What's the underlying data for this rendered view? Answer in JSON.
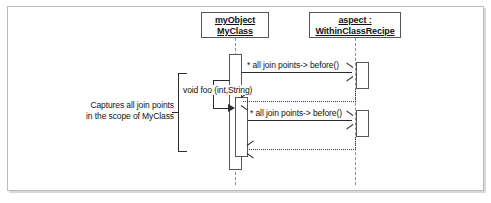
{
  "diagram": {
    "type": "uml-sequence-diagram",
    "title": "",
    "lifelines": [
      {
        "id": "myobject",
        "name_line_1": "myObject",
        "name_line_2": "MyClass",
        "underlined": true
      },
      {
        "id": "aspect",
        "name_line_1": "aspect :",
        "name_line_2": "WithinClassRecipe",
        "underlined": true
      }
    ],
    "messages": [
      {
        "id": "call-1",
        "label": "* all join points-> before()",
        "from": "myobject",
        "to": "aspect",
        "style": "solid",
        "arrow": "open"
      },
      {
        "id": "return-1",
        "label": "",
        "from": "aspect",
        "to": "myobject",
        "style": "dotted",
        "arrow": "open"
      },
      {
        "id": "self-call-foo",
        "label": "void foo (int,String)",
        "from": "myobject",
        "to": "myobject",
        "style": "solid",
        "arrow": "filled"
      },
      {
        "id": "call-2",
        "label": "* all join points-> before()",
        "from": "myobject",
        "to": "aspect",
        "style": "solid",
        "arrow": "open"
      },
      {
        "id": "return-2",
        "label": "",
        "from": "aspect",
        "to": "myobject",
        "style": "dotted",
        "arrow": "open"
      }
    ],
    "annotation": {
      "line_1": "Captures all join points",
      "line_2": "in the scope of MyClass"
    },
    "colors": {
      "stroke": "#2b2c2f",
      "box_border": "#55565a",
      "lifeline": "#8d8e92",
      "frame_border": "#b9babc",
      "background": "#ffffff",
      "text": "#111214"
    }
  }
}
